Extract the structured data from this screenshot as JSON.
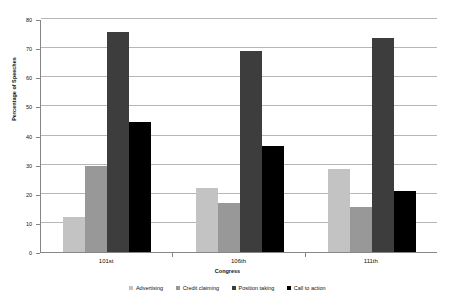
{
  "chart_data": {
    "type": "bar",
    "title": "",
    "xlabel": "Congress",
    "ylabel": "Percentage of Speeches",
    "categories": [
      "101st",
      "106th",
      "111th"
    ],
    "ylim": [
      0,
      80
    ],
    "ytick_step": 10,
    "yticks": [
      0,
      10,
      20,
      30,
      40,
      50,
      60,
      70,
      80
    ],
    "grid": true,
    "legend_position": "bottom",
    "series": [
      {
        "name": "Advertising",
        "color": "#c3c3c3",
        "values": [
          12.0,
          22.0,
          28.5
        ]
      },
      {
        "name": "Credit claiming",
        "color": "#989898",
        "values": [
          29.5,
          17.0,
          15.5
        ]
      },
      {
        "name": "Position taking",
        "color": "#3d3d3d",
        "values": [
          75.5,
          69.0,
          73.5
        ]
      },
      {
        "name": "Call to action",
        "color": "#000000",
        "values": [
          44.5,
          36.5,
          21.0
        ]
      }
    ]
  },
  "axis_colors": {
    "gridline": "#b7b7b7",
    "axis_line": "#868686",
    "text": "#111111"
  }
}
